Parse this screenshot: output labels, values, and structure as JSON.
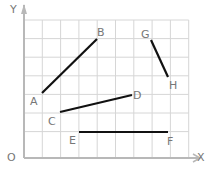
{
  "diagram": {
    "axes": {
      "origin_label": "O",
      "x_label": "X",
      "y_label": "Y"
    },
    "grid": {
      "x_lines": [
        24,
        42.3,
        60.6,
        78.9,
        97.2,
        115.5,
        133.8,
        152.1,
        170.4,
        188.7
      ],
      "y_lines": [
        20,
        38.6,
        57.2,
        75.8,
        94.4,
        113,
        131.6,
        158
      ]
    },
    "colors": {
      "grid": "#d6d6d6",
      "axis": "#b8b8b8",
      "segment": "#111111",
      "label": "#777777"
    },
    "points": [
      {
        "name": "A",
        "x": 42,
        "y": 93,
        "lx": 30,
        "ly": 96
      },
      {
        "name": "B",
        "x": 97,
        "y": 39,
        "lx": 97,
        "ly": 27
      },
      {
        "name": "C",
        "x": 60,
        "y": 112,
        "lx": 48,
        "ly": 116
      },
      {
        "name": "D",
        "x": 132,
        "y": 95,
        "lx": 133,
        "ly": 90
      },
      {
        "name": "E",
        "x": 79,
        "y": 132,
        "lx": 69,
        "ly": 135
      },
      {
        "name": "F",
        "x": 168,
        "y": 132,
        "lx": 167,
        "ly": 136
      },
      {
        "name": "G",
        "x": 151,
        "y": 40,
        "lx": 141,
        "ly": 29
      },
      {
        "name": "H",
        "x": 168,
        "y": 77,
        "lx": 169,
        "ly": 80
      }
    ],
    "segments": [
      {
        "from": "A",
        "to": "B"
      },
      {
        "from": "G",
        "to": "H"
      },
      {
        "from": "C",
        "to": "D"
      },
      {
        "from": "E",
        "to": "F"
      }
    ]
  }
}
